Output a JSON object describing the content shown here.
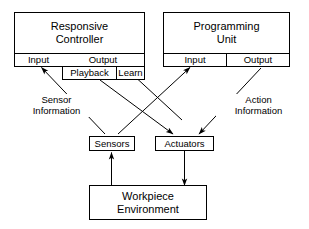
{
  "diagram": {
    "stroke_color": "#000000",
    "background_color": "#ffffff",
    "blocks": {
      "responsive_controller": {
        "line1": "Responsive",
        "line2": "Controller",
        "input_label": "Input",
        "output_label": "Output",
        "playback_label": "Playback",
        "learn_label": "Learn"
      },
      "programming_unit": {
        "line1": "Programming",
        "line2": "Unit",
        "input_label": "Input",
        "output_label": "Output"
      },
      "sensors": {
        "label": "Sensors"
      },
      "actuators": {
        "label": "Actuators"
      },
      "workpiece": {
        "line1": "Workpiece",
        "line2": "Environment"
      }
    },
    "edge_labels": {
      "sensor_information": {
        "line1": "Sensor",
        "line2": "Information"
      },
      "action_information": {
        "line1": "Action",
        "line2": "Information"
      }
    },
    "connections": [
      {
        "from": "sensors",
        "to": "responsive-controller-input",
        "style": "arrow"
      },
      {
        "from": "sensors",
        "to": "programming-unit-input",
        "style": "arrow"
      },
      {
        "from": "responsive-controller-playback",
        "to": "actuators",
        "style": "arrow"
      },
      {
        "from": "programming-unit-output",
        "to": "actuators",
        "style": "arrow"
      },
      {
        "from": "programming-unit",
        "to": "responsive-controller-learn",
        "style": "arrow"
      },
      {
        "from": "workpiece",
        "to": "sensors",
        "style": "arrow"
      },
      {
        "from": "actuators",
        "to": "workpiece",
        "style": "arrow"
      }
    ]
  }
}
